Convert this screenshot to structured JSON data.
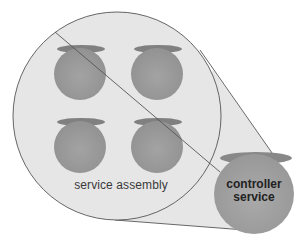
{
  "diagram": {
    "type": "service-composition",
    "nodes": [
      {
        "id": "service-assembly",
        "label": "service assembly",
        "shape": "large-circle"
      },
      {
        "id": "controller-service",
        "label_line1": "controller",
        "label_line2": "service",
        "shape": "circle"
      },
      {
        "id": "service-1",
        "label": "",
        "shape": "small-circle"
      },
      {
        "id": "service-2",
        "label": "",
        "shape": "small-circle"
      },
      {
        "id": "service-3",
        "label": "",
        "shape": "small-circle"
      },
      {
        "id": "service-4",
        "label": "",
        "shape": "small-circle"
      }
    ],
    "colors": {
      "assembly_fill": "#e6e6e6",
      "outline": "#555555",
      "service_fill": "#9a9a9a",
      "service_shade": "#7f7f7f",
      "controller_fill": "#a2a2a2"
    }
  }
}
